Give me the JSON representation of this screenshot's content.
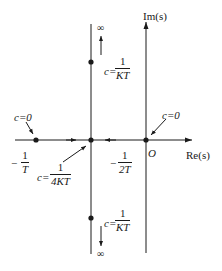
{
  "diagram": {
    "type": "root-locus",
    "axes": {
      "real_label": "Re(s)",
      "imag_label": "Im(s)",
      "origin_label": "O"
    },
    "points": [
      {
        "id": "pole-neg-1-over-T",
        "label_sign": "−",
        "label_num": "1",
        "label_den": "T",
        "note": "c=0"
      },
      {
        "id": "breakaway",
        "label_prefix": "c=",
        "label_num": "1",
        "label_den": "4KT"
      },
      {
        "id": "origin-pole",
        "note": "c=0"
      },
      {
        "id": "upper-point",
        "label_prefix": "c=",
        "label_num": "1",
        "label_den": "KT"
      },
      {
        "id": "lower-point",
        "label_prefix": "c=",
        "label_num": "1",
        "label_den": "KT"
      }
    ],
    "asymptote": {
      "label_sign": "−",
      "label_num": "1",
      "label_den": "2T"
    },
    "infinity_top": "∞",
    "infinity_bottom": "∞",
    "colors": {
      "line": "#1a1a1a",
      "background": "#ffffff"
    }
  }
}
